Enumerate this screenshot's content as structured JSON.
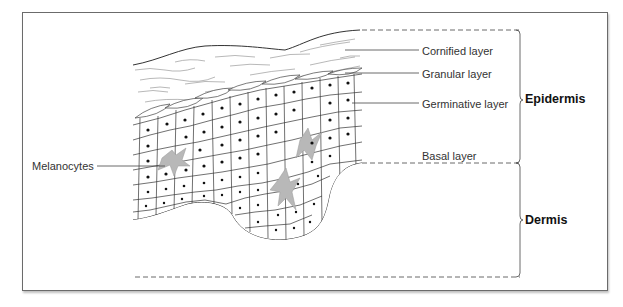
{
  "diagram": {
    "labels": {
      "cornified": "Cornified layer",
      "granular": "Granular layer",
      "germinative": "Germinative layer",
      "basal": "Basal layer",
      "melanocytes": "Melanocytes"
    },
    "regions": {
      "epidermis": "Epidermis",
      "dermis": "Dermis"
    },
    "colors": {
      "outline": "#333333",
      "melanocyte_fill": "#b8b8b8",
      "nucleus": "#111111",
      "frame": "#6b6b6b"
    }
  }
}
